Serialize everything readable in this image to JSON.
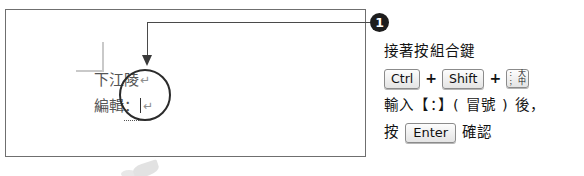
{
  "document": {
    "lines": [
      {
        "text": "下江陵",
        "mark": "↵"
      },
      {
        "label": "編輯",
        "colon": "：",
        "mark": "↵"
      }
    ]
  },
  "callout": {
    "badge": "1",
    "line1": "接著按組合鍵",
    "keys": {
      "key1": "Ctrl",
      "plus1": "+",
      "key2": "Shift",
      "plus2": "+",
      "key3_legend_top": "：",
      "key3_legend_bottom": "；",
      "key3_legend_top_right": "大",
      "key3_legend_bottom_right": "中"
    },
    "line3": "輸入【：】( 冒號 ) 後，",
    "line4_prefix": "按",
    "line4_key": "Enter",
    "line4_suffix": "確認"
  },
  "colors": {
    "frame_border": "#6f6f6f",
    "leader_line": "#4a4a4a",
    "badge_bg": "#1d1d1d",
    "badge_fg": "#ffffff",
    "emphasis_circle": "#2b2b2b",
    "doc_text": "#555555",
    "instruction_text": "#131313",
    "boundary_mark": "#c9c9c9"
  }
}
